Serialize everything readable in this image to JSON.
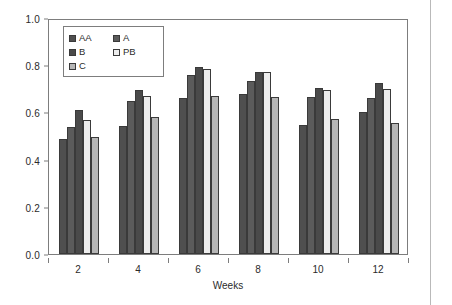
{
  "chart_data": {
    "type": "bar",
    "title": "",
    "subtitle": "",
    "xlabel": "Weeks",
    "ylabel": "",
    "categories": [
      "2",
      "4",
      "6",
      "8",
      "10",
      "12"
    ],
    "ylim": [
      0.0,
      1.0
    ],
    "y_ticks": [
      "0.0",
      "0.2",
      "0.4",
      "0.6",
      "0.8",
      "1.0"
    ],
    "y_tick_values": [
      0.0,
      0.2,
      0.4,
      0.6,
      0.8,
      1.0
    ],
    "grid": false,
    "legend_position": "top-left-inside",
    "series": [
      {
        "name": "AA",
        "color": "#4f4f4f",
        "values": [
          0.487,
          0.543,
          0.659,
          0.679,
          0.546,
          0.6
        ]
      },
      {
        "name": "A",
        "color": "#5b5b5b",
        "values": [
          0.539,
          0.649,
          0.759,
          0.735,
          0.665,
          0.66
        ]
      },
      {
        "name": "B",
        "color": "#4a4a4a",
        "values": [
          0.609,
          0.695,
          0.791,
          0.77,
          0.704,
          0.726
        ]
      },
      {
        "name": "PB",
        "color": "#ededed",
        "values": [
          0.568,
          0.668,
          0.784,
          0.773,
          0.694,
          0.701
        ]
      },
      {
        "name": "C",
        "color": "#b6b6b6",
        "values": [
          0.497,
          0.58,
          0.669,
          0.665,
          0.574,
          0.554
        ]
      }
    ]
  },
  "legend": {
    "entries": [
      {
        "label": "AA"
      },
      {
        "label": "A"
      },
      {
        "label": "B"
      },
      {
        "label": "PB"
      },
      {
        "label": "C"
      }
    ]
  },
  "axes": {
    "x_title": "Weeks"
  },
  "colors": {
    "frame": "#7d7d7d",
    "bar_outline": "#3a3a3a",
    "text": "#2b2b2b",
    "page_edge": "#b9b9b9"
  }
}
